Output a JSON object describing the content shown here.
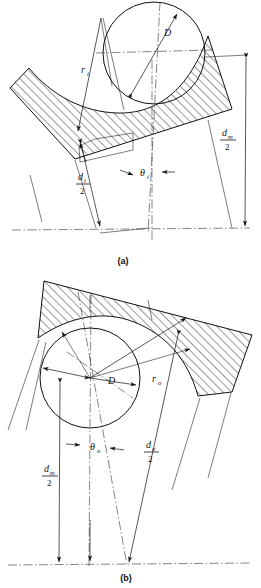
{
  "figure": {
    "panels": [
      {
        "id": "a",
        "caption": "(a)",
        "description": "Inner raceway groove with ball",
        "labels": {
          "ball_diameter": "D",
          "groove_radius_main": "r",
          "groove_radius_sub": "i",
          "race_diameter_main": "d",
          "race_diameter_sub": "i",
          "race_diameter_denom": "2",
          "pitch_diameter_main": "d",
          "pitch_diameter_sub": "m",
          "pitch_diameter_denom": "2",
          "angle_main": "θ",
          "angle_sub": "i"
        }
      },
      {
        "id": "b",
        "caption": "(b)",
        "description": "Outer raceway groove with ball",
        "labels": {
          "ball_diameter": "D",
          "groove_radius_main": "r",
          "groove_radius_sub": "o",
          "race_diameter_main": "d",
          "race_diameter_sub": "o",
          "race_diameter_denom": "2",
          "pitch_diameter_main": "d",
          "pitch_diameter_sub": "m",
          "pitch_diameter_denom": "2",
          "angle_main": "θ",
          "angle_sub": "o"
        }
      }
    ],
    "colors": {
      "line": "#111111",
      "centerline": "#333333",
      "background": "#ffffff"
    }
  }
}
